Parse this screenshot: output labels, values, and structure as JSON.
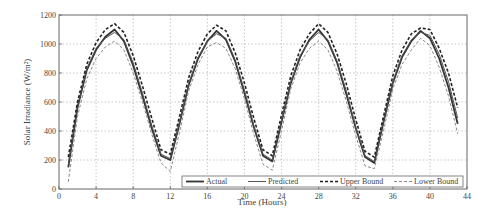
{
  "chart_data": {
    "type": "line",
    "title": "",
    "xlabel": "Time (Hours)",
    "ylabel": "Solar Irradiance (W/m²)",
    "xlim": [
      0,
      44
    ],
    "ylim": [
      0,
      1200
    ],
    "xticks": [
      0,
      4,
      8,
      12,
      16,
      20,
      24,
      28,
      32,
      36,
      40,
      44
    ],
    "yticks": [
      0,
      200,
      400,
      600,
      800,
      1000,
      1200
    ],
    "grid": true,
    "legend_position": "lower right (inside)",
    "series": [
      {
        "name": "Actual",
        "style": "solid-thick",
        "x": [
          1,
          2,
          3,
          4,
          5,
          6,
          7,
          8,
          9,
          10,
          11,
          12,
          13,
          14,
          15,
          16,
          17,
          18,
          19,
          20,
          21,
          22,
          23,
          24,
          25,
          26,
          27,
          28,
          29,
          30,
          31,
          32,
          33,
          34,
          35,
          36,
          37,
          38,
          39,
          40,
          41,
          42,
          43
        ],
        "y": [
          150,
          560,
          820,
          960,
          1050,
          1100,
          1020,
          850,
          640,
          420,
          230,
          200,
          450,
          720,
          900,
          1020,
          1090,
          1030,
          880,
          660,
          430,
          230,
          190,
          460,
          730,
          910,
          1030,
          1100,
          1020,
          870,
          650,
          420,
          220,
          180,
          460,
          730,
          910,
          1020,
          1090,
          1040,
          900,
          700,
          450
        ]
      },
      {
        "name": "Predicted",
        "style": "solid",
        "x": [
          1,
          2,
          3,
          4,
          5,
          6,
          7,
          8,
          9,
          10,
          11,
          12,
          13,
          14,
          15,
          16,
          17,
          18,
          19,
          20,
          21,
          22,
          23,
          24,
          25,
          26,
          27,
          28,
          29,
          30,
          31,
          32,
          33,
          34,
          35,
          36,
          37,
          38,
          39,
          40,
          41,
          42,
          43
        ],
        "y": [
          170,
          570,
          830,
          970,
          1040,
          1080,
          1030,
          870,
          660,
          440,
          240,
          210,
          460,
          730,
          910,
          1020,
          1070,
          1040,
          890,
          680,
          440,
          240,
          200,
          470,
          740,
          920,
          1020,
          1080,
          1030,
          880,
          670,
          430,
          230,
          190,
          470,
          740,
          920,
          1030,
          1080,
          1060,
          930,
          740,
          490
        ]
      },
      {
        "name": "Upper Bound",
        "style": "dashed-thick",
        "x": [
          1,
          2,
          3,
          4,
          5,
          6,
          7,
          8,
          9,
          10,
          11,
          12,
          13,
          14,
          15,
          16,
          17,
          18,
          19,
          20,
          21,
          22,
          23,
          24,
          25,
          26,
          27,
          28,
          29,
          30,
          31,
          32,
          33,
          34,
          35,
          36,
          37,
          38,
          39,
          40,
          41,
          42,
          43
        ],
        "y": [
          220,
          600,
          860,
          1010,
          1100,
          1140,
          1080,
          920,
          710,
          490,
          270,
          240,
          500,
          770,
          950,
          1070,
          1130,
          1090,
          940,
          730,
          490,
          270,
          230,
          510,
          780,
          960,
          1070,
          1140,
          1080,
          930,
          720,
          480,
          260,
          220,
          500,
          780,
          960,
          1070,
          1110,
          1100,
          970,
          800,
          560
        ]
      },
      {
        "name": "Lower Bound",
        "style": "dashed-light",
        "x": [
          1,
          2,
          3,
          4,
          5,
          6,
          7,
          8,
          9,
          10,
          11,
          12,
          13,
          14,
          15,
          16,
          17,
          18,
          19,
          20,
          21,
          22,
          23,
          24,
          25,
          26,
          27,
          28,
          29,
          30,
          31,
          32,
          33,
          34,
          35,
          36,
          37,
          38,
          39,
          40,
          41,
          42,
          43
        ],
        "y": [
          50,
          500,
          760,
          900,
          980,
          1020,
          960,
          800,
          600,
          380,
          180,
          120,
          390,
          680,
          860,
          980,
          1010,
          970,
          830,
          620,
          380,
          170,
          130,
          400,
          690,
          870,
          970,
          1020,
          960,
          810,
          600,
          370,
          160,
          140,
          400,
          690,
          860,
          960,
          1040,
          990,
          840,
          640,
          380
        ]
      }
    ]
  },
  "colors": {
    "actual": "#333333",
    "predicted": "#555555",
    "upper": "#222222",
    "lower": "#888888",
    "grid": "#b0b0b0",
    "axis": "#666666"
  }
}
